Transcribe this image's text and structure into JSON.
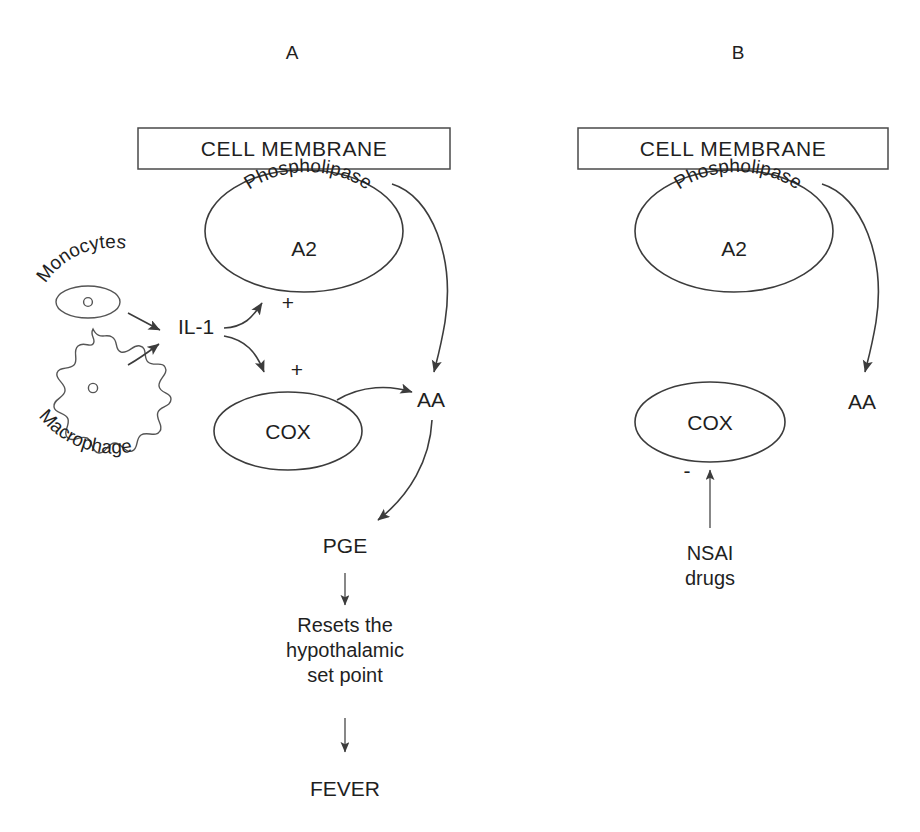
{
  "figure": {
    "type": "biological-pathway-diagram",
    "background_color": "#ffffff",
    "line_color": "#3c3c3c",
    "text_color": "#1f1f1f",
    "width": 920,
    "height": 832
  },
  "panels": [
    {
      "id": "A",
      "label": "A",
      "membrane_label": "CELL MEMBRANE",
      "nodes": {
        "monocytes": "Monocytes",
        "macrophage": "Macrophage",
        "il1": "IL-1",
        "phospholipase_top": "Phospholipase",
        "phospholipase_bottom": "A2",
        "cox": "COX",
        "aa": "AA",
        "pge": "PGE",
        "resets_line1": "Resets the",
        "resets_line2": "hypothalamic",
        "resets_line3": "set point",
        "fever": "FEVER"
      },
      "signs": {
        "phospholipase_activation": "+",
        "cox_activation": "+"
      },
      "arrows": [
        {
          "from": "monocytes",
          "to": "il1",
          "sign": ""
        },
        {
          "from": "macrophage",
          "to": "il1",
          "sign": ""
        },
        {
          "from": "il1",
          "to": "phospholipase-a2",
          "sign": "+"
        },
        {
          "from": "il1",
          "to": "cox",
          "sign": "+"
        },
        {
          "from": "phospholipase-a2",
          "to": "aa",
          "sign": ""
        },
        {
          "from": "cox",
          "to": "aa",
          "sign": ""
        },
        {
          "from": "aa",
          "to": "pge",
          "sign": ""
        },
        {
          "from": "pge",
          "to": "resets-hypothalamic-set-point",
          "sign": ""
        },
        {
          "from": "resets-hypothalamic-set-point",
          "to": "fever",
          "sign": ""
        }
      ]
    },
    {
      "id": "B",
      "label": "B",
      "membrane_label": "CELL MEMBRANE",
      "nodes": {
        "phospholipase_top": "Phospholipase",
        "phospholipase_bottom": "A2",
        "cox": "COX",
        "aa": "AA",
        "nsai_line1": "NSAI",
        "nsai_line2": "drugs"
      },
      "signs": {
        "cox_inhibition": "-"
      },
      "arrows": [
        {
          "from": "phospholipase-a2",
          "to": "aa",
          "sign": ""
        },
        {
          "from": "nsai-drugs",
          "to": "cox",
          "sign": "-"
        }
      ]
    }
  ],
  "curved_text": {
    "phospholipase_letters": [
      "P",
      "h",
      "o",
      "s",
      "p",
      "h",
      "o",
      "l",
      "i",
      "p",
      "a",
      "s",
      "e"
    ],
    "monocytes_letters": [
      "M",
      "o",
      "n",
      "o",
      "c",
      "y",
      "t",
      "e",
      "s"
    ],
    "macrophage_letters": [
      "M",
      "a",
      "c",
      "r",
      "o",
      "p",
      "h",
      "a",
      "g",
      "e"
    ]
  }
}
